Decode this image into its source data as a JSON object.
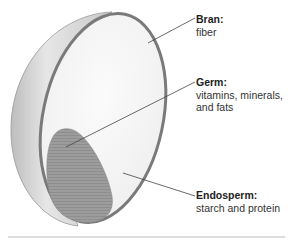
{
  "diagram": {
    "colors": {
      "shell_fill": "#d4d4d4",
      "rim": "#7a7a7a",
      "endosperm_fill": "#f4f4f4",
      "germ_fill": "#9a9a9a",
      "leader_line": "#444444",
      "rule": "#bbbbbb"
    },
    "labels": [
      {
        "id": "bran",
        "title": "Bran:",
        "desc_lines": [
          "fiber"
        ]
      },
      {
        "id": "germ",
        "title": "Germ:",
        "desc_lines": [
          "vitamins, minerals,",
          "and fats"
        ]
      },
      {
        "id": "endosperm",
        "title": "Endosperm:",
        "desc_lines": [
          "starch and protein"
        ]
      }
    ]
  }
}
